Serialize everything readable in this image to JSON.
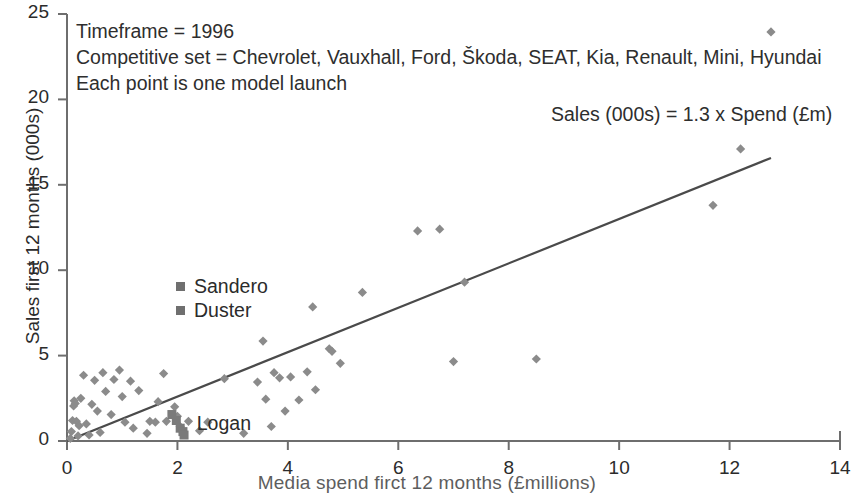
{
  "chart_data": {
    "type": "scatter",
    "title": "",
    "xlabel": "Media spend firct 12 months (£millions)",
    "ylabel": "Sales first 12 months (000s)",
    "xlim": [
      0,
      14
    ],
    "ylim": [
      0,
      25
    ],
    "xticks": [
      0,
      2,
      4,
      6,
      8,
      10,
      12,
      14
    ],
    "yticks": [
      0,
      5,
      10,
      15,
      20,
      25
    ],
    "grid": false,
    "legend_position": "inside-left",
    "annotations": [
      "Timeframe = 1996",
      "Competitive set = Chevrolet, Vauxhall, Ford, Škoda, SEAT, Kia, Renault, Mini, Hyundai",
      "Each point is one model launch"
    ],
    "equation": "Sales (000s) = 1.3 x Spend (£m)",
    "trendline": {
      "slope": 1.3,
      "intercept": 0,
      "x_start": 0,
      "x_end": 12.75
    },
    "legend": [
      {
        "label": "Sandero",
        "marker": "square",
        "color": "#6f6f6f"
      },
      {
        "label": "Duster",
        "marker": "square",
        "color": "#6f6f6f"
      }
    ],
    "point_labels": [
      {
        "text": "Logan",
        "x": 2.35,
        "y": 0.95
      }
    ],
    "series": [
      {
        "name": "Model launches",
        "marker": "diamond",
        "color": "#8b8b8b",
        "points": [
          [
            0.06,
            0.15
          ],
          [
            0.08,
            0.55
          ],
          [
            0.1,
            1.2
          ],
          [
            0.12,
            2.05
          ],
          [
            0.13,
            2.35
          ],
          [
            0.15,
            2.2
          ],
          [
            0.17,
            1.15
          ],
          [
            0.2,
            0.3
          ],
          [
            0.22,
            0.9
          ],
          [
            0.25,
            2.5
          ],
          [
            0.3,
            3.85
          ],
          [
            0.35,
            1.0
          ],
          [
            0.4,
            0.35
          ],
          [
            0.45,
            2.15
          ],
          [
            0.5,
            3.55
          ],
          [
            0.55,
            1.75
          ],
          [
            0.6,
            0.5
          ],
          [
            0.65,
            4.0
          ],
          [
            0.7,
            2.9
          ],
          [
            0.8,
            1.55
          ],
          [
            0.85,
            3.6
          ],
          [
            0.95,
            4.15
          ],
          [
            1.0,
            2.6
          ],
          [
            1.05,
            1.1
          ],
          [
            1.15,
            3.5
          ],
          [
            1.2,
            0.75
          ],
          [
            1.3,
            2.95
          ],
          [
            1.45,
            0.45
          ],
          [
            1.5,
            1.15
          ],
          [
            1.6,
            1.1
          ],
          [
            1.65,
            2.3
          ],
          [
            1.75,
            3.95
          ],
          [
            1.8,
            1.15
          ],
          [
            1.95,
            2.0
          ],
          [
            2.0,
            1.45
          ],
          [
            2.05,
            0.85
          ],
          [
            2.2,
            1.15
          ],
          [
            2.4,
            0.6
          ],
          [
            2.55,
            1.1
          ],
          [
            2.85,
            3.65
          ],
          [
            3.2,
            0.45
          ],
          [
            3.45,
            3.45
          ],
          [
            3.55,
            5.85
          ],
          [
            3.6,
            2.45
          ],
          [
            3.7,
            0.85
          ],
          [
            3.75,
            4.0
          ],
          [
            3.85,
            3.7
          ],
          [
            3.95,
            1.75
          ],
          [
            4.05,
            3.75
          ],
          [
            4.2,
            2.4
          ],
          [
            4.35,
            4.05
          ],
          [
            4.45,
            7.85
          ],
          [
            4.5,
            3.0
          ],
          [
            4.75,
            5.4
          ],
          [
            4.8,
            5.25
          ],
          [
            4.95,
            4.55
          ],
          [
            5.35,
            8.7
          ],
          [
            6.35,
            12.3
          ],
          [
            6.75,
            12.4
          ],
          [
            7.0,
            4.65
          ],
          [
            7.2,
            9.3
          ],
          [
            8.5,
            4.8
          ],
          [
            11.7,
            13.8
          ],
          [
            12.2,
            17.1
          ],
          [
            12.75,
            23.95
          ]
        ]
      },
      {
        "name": "Dacia models",
        "marker": "square",
        "color": "#7a7a7a",
        "points": [
          [
            1.9,
            1.55
          ],
          [
            1.98,
            1.2
          ],
          [
            2.05,
            0.75
          ],
          [
            2.1,
            0.55
          ],
          [
            2.12,
            0.35
          ]
        ]
      }
    ]
  }
}
